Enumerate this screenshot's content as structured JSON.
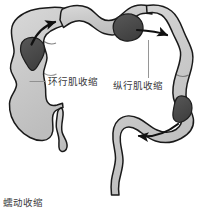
{
  "figure": {
    "title_caption": "蠕动收缩",
    "background_color": "#ffffff",
    "wall_outline_color": "#1a1a1a",
    "lumen_fill_color": "#c9c9c9",
    "lumen_fill_light": "#d6d6d6",
    "mass_fill_color": "#4a4a4a",
    "arrow_color": "#111111",
    "leader_line_color": "#7a7a7a",
    "text_color": "#38383a"
  },
  "labels": {
    "circular": {
      "text": "环行肌收缩",
      "leader": "horizontal-leader-line"
    },
    "longitudinal": {
      "text": "纵行肌收缩",
      "leader": "vertical-leader-line"
    }
  },
  "arrows": [
    {
      "name": "ascending-colon-arrow",
      "direction": "right"
    },
    {
      "name": "transverse-colon-arrow",
      "direction": "right"
    },
    {
      "name": "descending-colon-arrow",
      "direction": "left"
    }
  ],
  "masses": [
    {
      "name": "fecal-mass-ascending"
    },
    {
      "name": "fecal-mass-hepatic-flexure"
    },
    {
      "name": "fecal-mass-splenic-flexure"
    },
    {
      "name": "fecal-mass-descending"
    }
  ],
  "anatomy": {
    "cecum": "cecum",
    "appendix": "appendix",
    "ascending_colon": "ascending-colon",
    "transverse_colon": "transverse-colon",
    "descending_colon": "descending-colon",
    "sigmoid_colon": "sigmoid-colon",
    "rectum": "rectum"
  }
}
